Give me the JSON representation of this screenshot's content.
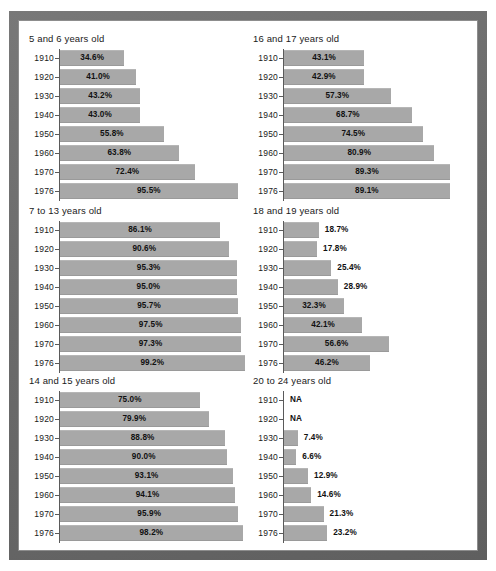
{
  "chart_data": [
    {
      "type": "bar",
      "title": "5 and 6 years old",
      "orientation": "horizontal",
      "xlabel": "",
      "ylabel": "",
      "xlim": [
        0,
        100
      ],
      "grid": false,
      "legend": "none",
      "categories": [
        "1910",
        "1920",
        "1930",
        "1940",
        "1950",
        "1960",
        "1970",
        "1976"
      ],
      "values": [
        34.6,
        41.0,
        43.2,
        43.0,
        55.8,
        63.8,
        72.4,
        95.5
      ],
      "labels": [
        "34.6%",
        "41.0%",
        "43.2%",
        "43.0%",
        "55.8%",
        "63.8%",
        "72.4%",
        "95.5%"
      ]
    },
    {
      "type": "bar",
      "title": "16 and 17 years old",
      "orientation": "horizontal",
      "xlabel": "",
      "ylabel": "",
      "xlim": [
        0,
        100
      ],
      "grid": false,
      "legend": "none",
      "categories": [
        "1910",
        "1920",
        "1930",
        "1940",
        "1950",
        "1960",
        "1970",
        "1976"
      ],
      "values": [
        43.1,
        42.9,
        57.3,
        68.7,
        74.5,
        80.9,
        89.3,
        89.1
      ],
      "labels": [
        "43.1%",
        "42.9%",
        "57.3%",
        "68.7%",
        "74.5%",
        "80.9%",
        "89.3%",
        "89.1%"
      ]
    },
    {
      "type": "bar",
      "title": "7 to 13 years old",
      "orientation": "horizontal",
      "xlabel": "",
      "ylabel": "",
      "xlim": [
        0,
        100
      ],
      "grid": false,
      "legend": "none",
      "categories": [
        "1910",
        "1920",
        "1930",
        "1940",
        "1950",
        "1960",
        "1970",
        "1976"
      ],
      "values": [
        86.1,
        90.6,
        95.3,
        95.0,
        95.7,
        97.5,
        97.3,
        99.2
      ],
      "labels": [
        "86.1%",
        "90.6%",
        "95.3%",
        "95.0%",
        "95.7%",
        "97.5%",
        "97.3%",
        "99.2%"
      ]
    },
    {
      "type": "bar",
      "title": "18 and 19 years old",
      "orientation": "horizontal",
      "xlabel": "",
      "ylabel": "",
      "xlim": [
        0,
        100
      ],
      "grid": false,
      "legend": "none",
      "categories": [
        "1910",
        "1920",
        "1930",
        "1940",
        "1950",
        "1960",
        "1970",
        "1976"
      ],
      "values": [
        18.7,
        17.8,
        25.4,
        28.9,
        32.3,
        42.1,
        56.6,
        46.2
      ],
      "labels": [
        "18.7%",
        "17.8%",
        "25.4%",
        "28.9%",
        "32.3%",
        "42.1%",
        "56.6%",
        "46.2%"
      ]
    },
    {
      "type": "bar",
      "title": "14 and 15 years old",
      "orientation": "horizontal",
      "xlabel": "",
      "ylabel": "",
      "xlim": [
        0,
        100
      ],
      "grid": false,
      "legend": "none",
      "categories": [
        "1910",
        "1920",
        "1930",
        "1940",
        "1950",
        "1960",
        "1970",
        "1976"
      ],
      "values": [
        75.0,
        79.9,
        88.8,
        90.0,
        93.1,
        94.1,
        95.9,
        98.2
      ],
      "labels": [
        "75.0%",
        "79.9%",
        "88.8%",
        "90.0%",
        "93.1%",
        "94.1%",
        "95.9%",
        "98.2%"
      ]
    },
    {
      "type": "bar",
      "title": "20 to 24 years old",
      "orientation": "horizontal",
      "xlabel": "",
      "ylabel": "",
      "xlim": [
        0,
        100
      ],
      "grid": false,
      "legend": "none",
      "categories": [
        "1910",
        "1920",
        "1930",
        "1940",
        "1950",
        "1960",
        "1970",
        "1976"
      ],
      "values": [
        null,
        null,
        7.4,
        6.6,
        12.9,
        14.6,
        21.3,
        23.2
      ],
      "labels": [
        "NA",
        "NA",
        "7.4%",
        "6.6%",
        "12.9%",
        "14.6%",
        "21.3%",
        "23.2%"
      ]
    }
  ],
  "style": {
    "bar_color": "#a8a8a8",
    "axis_color": "#5a5a5a",
    "text_color": "#1a1a1a",
    "frame_color": "#6e6e6e",
    "sheet_color": "#ffffff"
  },
  "layout": {
    "panel_order": [
      0,
      1,
      2,
      3,
      4,
      5
    ],
    "columns": 2,
    "rows": 3,
    "inside_label_threshold": 30
  }
}
